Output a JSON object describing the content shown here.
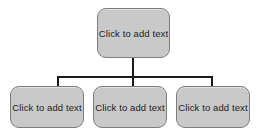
{
  "diagram": {
    "type": "organization-chart",
    "background_color": "#ffffff",
    "node_fill_color": "#c9c9c9",
    "node_border_color": "#7d7d7d",
    "connector_color": "#1a1a1a",
    "text_color": "#1b1b1b",
    "parent": {
      "label": "Click to add text"
    },
    "children": [
      {
        "label": "Click to add text"
      },
      {
        "label": "Click to add text"
      },
      {
        "label": "Click to add text"
      }
    ]
  }
}
